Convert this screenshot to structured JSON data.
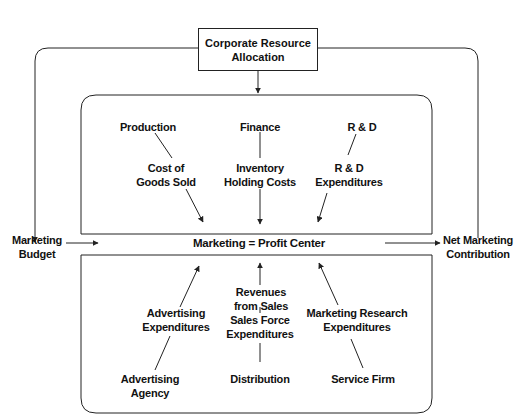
{
  "diagram": {
    "type": "flow",
    "title_node": {
      "id": "corporate",
      "lines": [
        "Corporate Resource",
        "Allocation"
      ]
    },
    "center_node": {
      "id": "profit_center",
      "text": "Marketing = Profit Center"
    },
    "left_node": {
      "id": "budget",
      "lines": [
        "Marketing",
        "Budget"
      ]
    },
    "right_node": {
      "id": "contribution",
      "lines": [
        "Net Marketing",
        "Contribution"
      ]
    },
    "upper_sources": [
      {
        "id": "production",
        "label": "Production",
        "cost": [
          "Cost of",
          "Goods Sold"
        ]
      },
      {
        "id": "finance",
        "label": "Finance",
        "cost": [
          "Inventory",
          "Holding Costs"
        ]
      },
      {
        "id": "rnd",
        "label": "R & D",
        "cost": [
          "R & D",
          "Expenditures"
        ]
      }
    ],
    "lower_sources": [
      {
        "id": "ad_agency",
        "label": [
          "Advertising",
          "Agency"
        ],
        "flow": [
          "Advertising",
          "Expenditures"
        ]
      },
      {
        "id": "distribution",
        "label": [
          "Distribution"
        ],
        "flow": [
          "Sales Force",
          "Expenditures"
        ],
        "flow2": [
          "Revenues",
          "from Sales"
        ]
      },
      {
        "id": "service_firm",
        "label": [
          "Service Firm"
        ],
        "flow": [
          "Marketing Research",
          "Expenditures"
        ]
      }
    ],
    "edges": [
      {
        "from": "corporate",
        "to": "upper_box"
      },
      {
        "from": "corporate",
        "to": "budget"
      },
      {
        "from": "contribution",
        "to": "corporate"
      },
      {
        "from": "budget",
        "to": "profit_center"
      },
      {
        "from": "profit_center",
        "to": "contribution"
      },
      {
        "from": "production",
        "to": "profit_center",
        "via": "Cost of Goods Sold"
      },
      {
        "from": "finance",
        "to": "profit_center",
        "via": "Inventory Holding Costs"
      },
      {
        "from": "rnd",
        "to": "profit_center",
        "via": "R & D Expenditures"
      },
      {
        "from": "ad_agency",
        "to": "profit_center",
        "via": "Advertising Expenditures"
      },
      {
        "from": "distribution",
        "to": "profit_center",
        "via": "Sales Force Expenditures / Revenues from Sales"
      },
      {
        "from": "service_firm",
        "to": "profit_center",
        "via": "Marketing Research Expenditures"
      }
    ]
  },
  "colors": {
    "line": "#222222",
    "background": "#ffffff"
  }
}
